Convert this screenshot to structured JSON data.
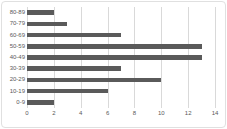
{
  "chart_data": {
    "type": "bar",
    "orientation": "horizontal",
    "title": "",
    "xlabel": "",
    "ylabel": "",
    "categories": [
      "80-89",
      "70-79",
      "60-69",
      "50-59",
      "40-49",
      "30-39",
      "20-29",
      "10-19",
      "0-9"
    ],
    "values": [
      2,
      3,
      7,
      13,
      13,
      7,
      10,
      6,
      2
    ],
    "xlim": [
      0,
      14
    ],
    "x_ticks": [
      0,
      2,
      4,
      6,
      8,
      10,
      12,
      14
    ],
    "grid": true,
    "legend_position": "none",
    "bar_color": "#5a5a5a",
    "gridline_color": "#d9d9d9",
    "axis_label_color": "#595959",
    "frame_color": "#e0e0e0",
    "background_color": "#ffffff"
  }
}
